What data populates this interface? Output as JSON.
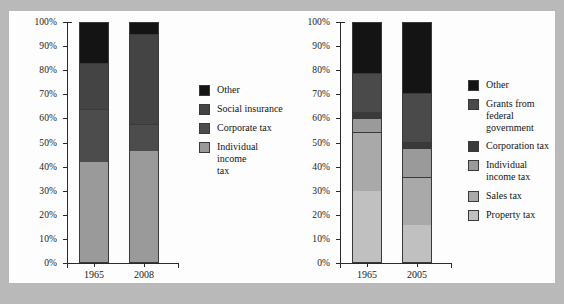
{
  "chart_data": [
    {
      "id": "federal-tax-revenue",
      "type": "bar",
      "subtype": "stacked-100-percent",
      "title": "",
      "xlabel": "",
      "ylabel": "",
      "categories": [
        "1965",
        "2008"
      ],
      "ylim": [
        0,
        100
      ],
      "ytick_labels": [
        "0%",
        "10%",
        "20%",
        "30%",
        "40%",
        "50%",
        "60%",
        "70%",
        "80%",
        "90%",
        "100%"
      ],
      "ytick_values": [
        0,
        10,
        20,
        30,
        40,
        50,
        60,
        70,
        80,
        90,
        100
      ],
      "grid": false,
      "legend_position": "right",
      "stack_order_bottom_to_top": [
        "Individual income tax",
        "Corporate tax",
        "Social insurance",
        "Other"
      ],
      "series": [
        {
          "name": "Individual income tax",
          "color": "#9a9a9a",
          "values": [
            41.3,
            45.9
          ]
        },
        {
          "name": "Corporate tax",
          "color": "#4c4c4c",
          "values": [
            22.3,
            11.5
          ]
        },
        {
          "name": "Social insurance",
          "color": "#444444",
          "values": [
            19.0,
            37.2
          ]
        },
        {
          "name": "Other",
          "color": "#141414",
          "values": [
            17.4,
            5.4
          ]
        }
      ],
      "legend": [
        {
          "label": "Other",
          "color": "#141414"
        },
        {
          "label": "Social insurance",
          "color": "#444444"
        },
        {
          "label": "Corporate tax",
          "color": "#4c4c4c"
        },
        {
          "label": "Individual income\ntax",
          "color": "#9a9a9a"
        }
      ]
    },
    {
      "id": "state-local-tax-revenue",
      "type": "bar",
      "subtype": "stacked-100-percent",
      "title": "",
      "xlabel": "",
      "ylabel": "",
      "categories": [
        "1965",
        "2005"
      ],
      "ylim": [
        0,
        100
      ],
      "ytick_labels": [
        "0%",
        "10%",
        "20%",
        "30%",
        "40%",
        "50%",
        "60%",
        "70%",
        "80%",
        "90%",
        "100%"
      ],
      "ytick_values": [
        0,
        10,
        20,
        30,
        40,
        50,
        60,
        70,
        80,
        90,
        100
      ],
      "grid": false,
      "legend_position": "right",
      "stack_order_bottom_to_top": [
        "Property tax",
        "Sales tax",
        "Individual income tax",
        "Corporation tax",
        "Grants from federal government",
        "Other"
      ],
      "series": [
        {
          "name": "Property tax",
          "color": "#c0c0c0",
          "values": [
            29.3,
            15.3
          ]
        },
        {
          "name": "Sales tax",
          "color": "#a9a9a9",
          "values": [
            24.8,
            19.8
          ]
        },
        {
          "name": "Individual income tax",
          "color": "#9a9a9a",
          "values": [
            5.8,
            12.4
          ]
        },
        {
          "name": "Corporation tax",
          "color": "#3a3a3a",
          "values": [
            2.5,
            2.5
          ]
        },
        {
          "name": "Grants from federal government",
          "color": "#4a4a4a",
          "values": [
            16.1,
            20.2
          ]
        },
        {
          "name": "Other",
          "color": "#141414",
          "values": [
            21.5,
            29.8
          ]
        }
      ],
      "legend": [
        {
          "label": "Other",
          "color": "#141414"
        },
        {
          "label": "Grants from federal\ngovernment",
          "color": "#4a4a4a"
        },
        {
          "label": "Corporation tax",
          "color": "#3a3a3a"
        },
        {
          "label": "Individual\nincome tax",
          "color": "#9a9a9a"
        },
        {
          "label": "Sales tax",
          "color": "#a9a9a9"
        },
        {
          "label": "Property tax",
          "color": "#c0c0c0"
        }
      ]
    }
  ]
}
